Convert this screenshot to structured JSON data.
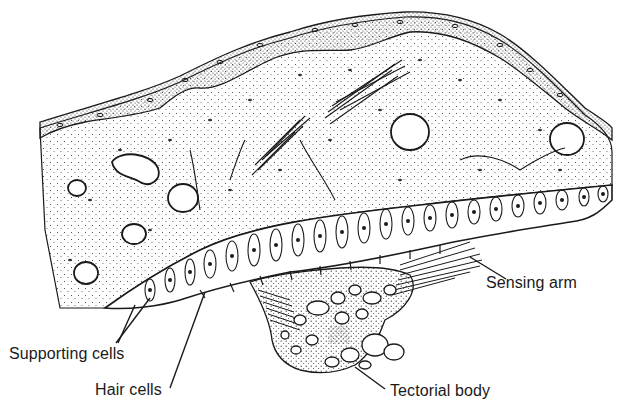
{
  "figure": {
    "type": "anatomical cross-section illustration",
    "ink_color": "#1a1a1a",
    "background_color": "#ffffff"
  },
  "labels": {
    "sensing_arm": "Sensing arm",
    "supporting_cells": "Supporting cells",
    "hair_cells": "Hair cells",
    "tectorial_body": "Tectorial body"
  }
}
